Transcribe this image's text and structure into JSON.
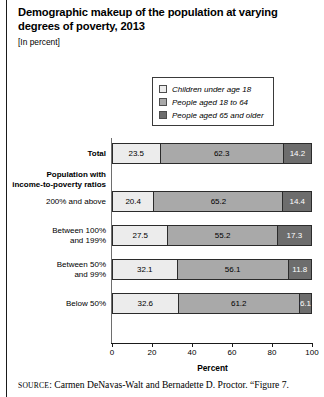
{
  "figure": {
    "title": "Demographic makeup of the population at varying degrees of poverty, 2013",
    "subtitle": "[In percent]",
    "axis_title": "Percent",
    "source_prefix": "SOURCE",
    "source_text": ": Carmen DeNavas-Walt and Bernadette D. Proctor. “Figure 7."
  },
  "legend": {
    "items": [
      {
        "label": "Children under age 18",
        "color": "#ececec"
      },
      {
        "label": "People aged 18 to 64",
        "color": "#a9a9a9"
      },
      {
        "label": "People aged 65 and older",
        "color": "#6d6d6d"
      }
    ]
  },
  "group_heading": "Population with\nincome-to-poverty ratios",
  "chart_data": {
    "type": "bar",
    "orientation": "horizontal",
    "stacked": true,
    "title": "Demographic makeup of the population at varying degrees of poverty, 2013",
    "subtitle": "[In percent]",
    "xlabel": "Percent",
    "ylabel": "",
    "xlim": [
      0,
      100
    ],
    "xticks": [
      0,
      20,
      40,
      60,
      80,
      100
    ],
    "xticklabels": [
      "0",
      "20",
      "40",
      "60",
      "80",
      "100"
    ],
    "grid": false,
    "legend_position": "top-right",
    "categories": [
      "Total",
      "200% and above",
      "Between 100%\nand 199%",
      "Between 50%\nand 99%",
      "Below 50%"
    ],
    "series": [
      {
        "name": "Children under age 18",
        "color": "#ececec",
        "values": [
          23.5,
          20.4,
          27.5,
          32.1,
          32.6
        ]
      },
      {
        "name": "People aged 18 to 64",
        "color": "#a9a9a9",
        "values": [
          62.3,
          65.2,
          55.2,
          56.1,
          61.2
        ]
      },
      {
        "name": "People aged 65 and older",
        "color": "#6d6d6d",
        "values": [
          14.2,
          14.4,
          17.3,
          11.8,
          6.1
        ]
      }
    ]
  }
}
